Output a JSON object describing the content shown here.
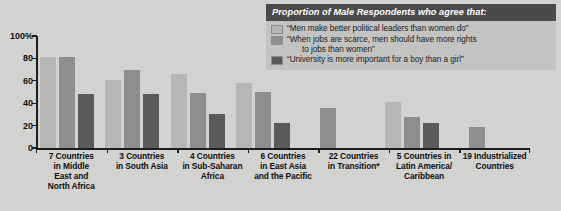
{
  "legend": {
    "title": "Proportion of Male Respondents who agree that:",
    "items": [
      {
        "label": "“Men make better political leaders than women do”",
        "color": "#b6b6b4"
      },
      {
        "label": "“When jobs are scarce, men should have more rights",
        "label_cont": "to jobs than women”",
        "color": "#8e8e8c"
      },
      {
        "label": "“University is more important for a boy than a girl”",
        "color": "#5a5a58"
      }
    ]
  },
  "axis": {
    "y_ticks": [
      "100%",
      "80",
      "60",
      "40",
      "20",
      "0"
    ],
    "y_values": [
      100,
      80,
      60,
      40,
      20,
      0
    ]
  },
  "chart_data": {
    "type": "bar",
    "title": "Proportion of Male Respondents who agree that:",
    "xlabel": "",
    "ylabel": "",
    "ylim": [
      0,
      100
    ],
    "grid": false,
    "legend_position": "top-right",
    "categories": [
      "7 Countries in Middle East and North Africa",
      "3 Countries in South Asia",
      "4 Countries in Sub-Saharan Africa",
      "6 Countries in East Asia and the Pacific",
      "22 Countries in Transition*",
      "5 Countries in Latin America/ Caribbean",
      "19 Industrialized Countries"
    ],
    "category_lines": [
      [
        "7 Countries",
        "in Middle",
        "East and",
        "North Africa"
      ],
      [
        "3 Countries",
        "in South Asia"
      ],
      [
        "4 Countries",
        "in Sub-Saharan",
        "Africa"
      ],
      [
        "6 Countries",
        "in East Asia",
        "and the Pacific"
      ],
      [
        "22 Countries",
        "in Transition*"
      ],
      [
        "5 Countries in",
        "Latin America/",
        "Caribbean"
      ],
      [
        "19 Industrialized",
        "Countries"
      ]
    ],
    "series": [
      {
        "name": "“Men make better political leaders than women do”",
        "color": "#b6b6b4",
        "values": [
          81,
          61,
          66,
          58,
          null,
          41,
          null
        ]
      },
      {
        "name": "“When jobs are scarce, men should have more rights to jobs than women”",
        "color": "#8e8e8c",
        "values": [
          81,
          70,
          49,
          50,
          36,
          28,
          19
        ]
      },
      {
        "name": "“University is more important for a boy than a girl”",
        "color": "#5a5a58",
        "values": [
          48,
          48,
          30,
          22,
          null,
          22,
          null
        ]
      }
    ]
  }
}
